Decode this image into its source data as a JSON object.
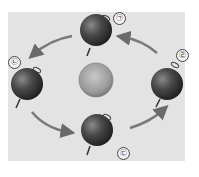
{
  "diagram": {
    "center": {
      "name": "sun",
      "color": "#a8a8a8"
    },
    "positions": [
      {
        "id": "top",
        "label": "㉠",
        "x": 97,
        "y": 30
      },
      {
        "id": "left",
        "label": "㉡",
        "x": 27,
        "y": 84
      },
      {
        "id": "bottom",
        "label": "㉢",
        "x": 97,
        "y": 130
      },
      {
        "id": "right",
        "label": "㉣",
        "x": 167,
        "y": 84
      }
    ],
    "direction": "counter-clockwise",
    "colors": {
      "background": "#e3e3e3",
      "earth": "#3a3a3a",
      "arrow": "#7a7a7a"
    }
  }
}
